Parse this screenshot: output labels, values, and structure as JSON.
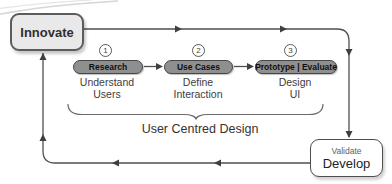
{
  "diagram": {
    "innovate_label": "Innovate",
    "steps": [
      {
        "number": "1",
        "pill": "Research",
        "line1": "Understand",
        "line2": "Users"
      },
      {
        "number": "2",
        "pill": "Use Cases",
        "line1": "Define",
        "line2": "Interaction"
      },
      {
        "number": "3",
        "pill": "Prototype | Evaluate",
        "line1": "Design",
        "line2": "UI"
      }
    ],
    "brace_label": "User Centred Design",
    "validate_label": "Validate",
    "develop_label": "Develop",
    "colors": {
      "background": "#ffffff",
      "connector_line": "#4f4f4f",
      "arrowhead": "#3f3f3f",
      "pill_fill": "#8f8f8f",
      "pill_border": "#474747",
      "innovate_fill": "#e9e9e9",
      "box_border": "#5c5c5c",
      "brace": "#6b6b6b",
      "swoosh": "#d6d6d6"
    }
  }
}
